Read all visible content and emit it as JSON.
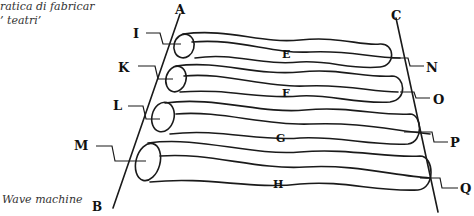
{
  "captions": {
    "top_line1": "ratica di fabricar",
    "top_line2": "’ teatri’",
    "bottom": "Wave machine"
  },
  "diagram": {
    "rods": [
      {
        "id": "A-B",
        "top_label": "A",
        "bottom_label": "B"
      },
      {
        "id": "C",
        "top_label": "C"
      }
    ],
    "cylinders": [
      {
        "left_label": "I",
        "center_label": "E",
        "right_label": "N"
      },
      {
        "left_label": "K",
        "center_label": "F",
        "right_label": "O"
      },
      {
        "left_label": "L",
        "center_label": "G",
        "right_label": "P"
      },
      {
        "left_label": "M",
        "center_label": "H",
        "right_label": "Q"
      }
    ],
    "colors": {
      "ink": "#1a1a1a",
      "paper": "#ffffff"
    }
  }
}
